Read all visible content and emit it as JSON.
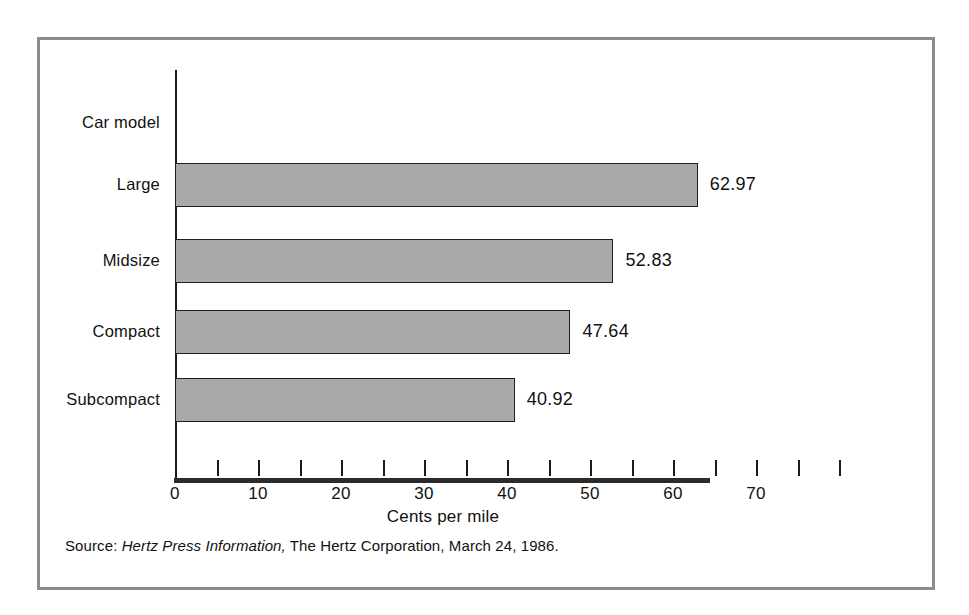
{
  "chart_data": {
    "type": "bar",
    "orientation": "horizontal",
    "title": "",
    "categories": [
      "Large",
      "Midsize",
      "Compact",
      "Subcompact"
    ],
    "values": [
      62.97,
      52.83,
      47.64,
      40.92
    ],
    "value_labels": [
      "62.97",
      "52.83",
      "47.64",
      "40.92"
    ],
    "xlabel": "Cents per mile",
    "ylabel": "Car model",
    "xlim": [
      0,
      80
    ],
    "xticks": [
      0,
      5,
      10,
      15,
      20,
      25,
      30,
      35,
      40,
      45,
      50,
      55,
      60,
      65,
      70,
      75,
      80
    ],
    "xtick_labels": [
      "0",
      "",
      "10",
      "",
      "20",
      "",
      "30",
      "",
      "40",
      "",
      "50",
      "",
      "60",
      "",
      "70",
      "",
      ""
    ],
    "labeled_ticks": [
      {
        "value": 0,
        "label": "0"
      },
      {
        "value": 10,
        "label": "10"
      },
      {
        "value": 20,
        "label": "20"
      },
      {
        "value": 30,
        "label": "30"
      },
      {
        "value": 40,
        "label": "40"
      },
      {
        "value": 50,
        "label": "50"
      },
      {
        "value": 60,
        "label": "60"
      },
      {
        "value": 70,
        "label": "70"
      }
    ],
    "grid": false,
    "legend": false,
    "bar_fill_color": "#a9a9a9",
    "bar_edge_color": "#1f1f1f",
    "axis_color": "#1a1a1a",
    "frame_color": "#8c8c8c"
  },
  "source": {
    "prefix": "Source:",
    "publication": "Hertz Press Information,",
    "rest": "The Hertz Corporation, March 24, 1986."
  }
}
